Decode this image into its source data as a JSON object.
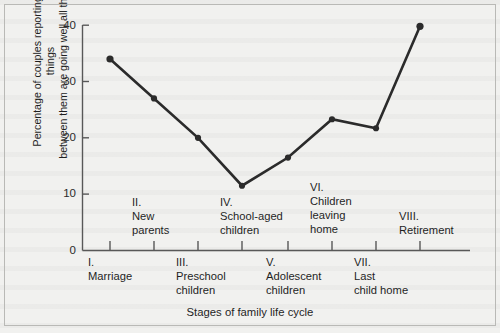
{
  "chart_data": {
    "type": "line",
    "title": "",
    "xlabel": "Stages of family life cycle",
    "ylabel": "Percentage of couples reporting that things\nbetween them are going well all the time ”",
    "ylim": [
      0,
      40
    ],
    "yticks": [
      0,
      10,
      20,
      30,
      40
    ],
    "ytick_labels": [
      "0",
      "10",
      "20",
      "30",
      "40"
    ],
    "grid": false,
    "legend": "none",
    "categories": [
      "I.\nMarriage",
      "II.\nNew\nparents",
      "III.\nPreschool\nchildren",
      "IV.\nSchool-aged\nchildren",
      "V.\nAdolescent\nchildren",
      "VI.\nChildren\nleaving\nhome",
      "VII.\nLast\nchild home",
      "VIII.\nRetirement"
    ],
    "values": [
      34,
      27,
      20,
      11.5,
      16.5,
      23.3,
      21.7,
      39.8
    ],
    "series": [
      {
        "name": "Percentage of couples reporting things going well all the time",
        "values": [
          34,
          27,
          20,
          11.5,
          16.5,
          23.3,
          21.7,
          39.8
        ]
      }
    ],
    "marker": "filled-circle",
    "line_color": "#2b2b2b"
  },
  "axes": {
    "y_tick_0": "0",
    "y_tick_10": "10",
    "y_tick_20": "20",
    "y_tick_30": "30",
    "y_tick_40": "40",
    "y_axis_title": "Percentage of couples reporting that things\nbetween them are going well all the time ”",
    "x_axis_title": "Stages of family life cycle"
  },
  "category_labels": {
    "stage_1": "I.\nMarriage",
    "stage_2": "II.\nNew\nparents",
    "stage_3": "III.\nPreschool\nchildren",
    "stage_4": "IV.\nSchool-aged\nchildren",
    "stage_5": "V.\nAdolescent\nchildren",
    "stage_6": "VI.\nChildren\nleaving\nhome",
    "stage_7": "VII.\nLast\nchild home",
    "stage_8": "VIII.\nRetirement"
  },
  "colors": {
    "page_background": "#f1f1ef",
    "frame_border": "#b9b9b6",
    "axis": "#585858",
    "series": "#2b2b2b",
    "text": "#1f1f1f"
  }
}
